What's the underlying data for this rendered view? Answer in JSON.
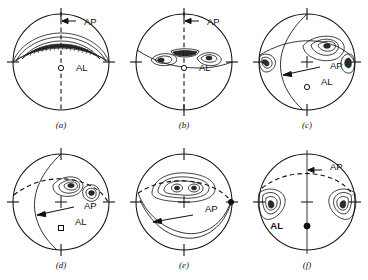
{
  "figure": {
    "type": "stereographic-projection-array",
    "rows": 2,
    "columns": 3,
    "background_color": "#ffffff",
    "line_color": "#111111"
  },
  "labels": {
    "ap": "AP",
    "al": "AL"
  },
  "panels": [
    {
      "id": "a",
      "caption": "(a)",
      "cx": 61,
      "cy": 62,
      "r": 48,
      "ap_label": "AP",
      "ap_label_x": 84,
      "ap_label_y": 25,
      "al_label": "AL",
      "al_label_x": 76,
      "al_label_y": 71,
      "al_marker_x": 61,
      "al_marker_y": 68,
      "al_marker_style": "open-circle",
      "axis_style": "dashed-vertical",
      "ap_arrow": "short-horizontal-left",
      "girdle": "narrow-horizontal-band",
      "fabric": "strong-girdle-with-dense-point-maximum",
      "has_center_cross": false
    },
    {
      "id": "b",
      "caption": "(b)",
      "cx": 184,
      "cy": 62,
      "r": 48,
      "ap_label": "AP",
      "ap_label_x": 207,
      "ap_label_y": 25,
      "al_label": "AL",
      "al_label_x": 199,
      "al_label_y": 71,
      "al_marker_x": 184,
      "al_marker_y": 68,
      "al_marker_style": "open-circle",
      "axis_style": "dashed-vertical",
      "ap_arrow": "short-horizontal-left",
      "girdle": "inclined-great-circle",
      "fabric": "two-lobes-plus-central-dense-maximum",
      "has_center_cross": false
    },
    {
      "id": "c",
      "caption": "(c)",
      "cx": 307,
      "cy": 62,
      "r": 48,
      "ap_label": "AP",
      "ap_label_x": 330,
      "ap_label_y": 69,
      "al_label": "AL",
      "al_label_x": 321,
      "al_label_y": 85,
      "al_marker_x": 307,
      "al_marker_y": 87,
      "al_marker_style": "open-circle",
      "axis_style": "inclined-great-circle",
      "ap_arrow": "long-diagonal-to-lower-left",
      "girdle": "inclined-girdle",
      "fabric": "one-strong-maximum-plus-edge-lobes",
      "has_center_cross": true
    },
    {
      "id": "d",
      "caption": "(d)",
      "cx": 61,
      "cy": 202,
      "r": 48,
      "ap_label": "AP",
      "ap_label_x": 84,
      "ap_label_y": 209,
      "al_label": "AL",
      "al_label_x": 75,
      "al_label_y": 225,
      "al_marker_x": 61,
      "al_marker_y": 228,
      "al_marker_style": "open-square",
      "axis_style": "inclined-great-circle",
      "ap_arrow": "long-diagonal-to-lower-left",
      "girdle": "dashed-inclined-girdle",
      "fabric": "two-separate-maxima",
      "has_center_cross": true
    },
    {
      "id": "e",
      "caption": "(e)",
      "cx": 184,
      "cy": 202,
      "r": 48,
      "ap_label": "AP",
      "ap_label_x": 205,
      "ap_label_y": 212,
      "al_label": "",
      "al_label_x": 0,
      "al_label_y": 0,
      "al_marker_x": 0,
      "al_marker_y": 0,
      "al_marker_style": "none",
      "axis_style": "dashed-small-circle",
      "ap_arrow": "short-diagonal-to-lower-left",
      "girdle": "broad-lower-girdle",
      "fabric": "elongate-contour-with-two-inner-maxima",
      "has_center_cross": true
    },
    {
      "id": "f",
      "caption": "(f)",
      "cx": 307,
      "cy": 202,
      "r": 48,
      "ap_label": "AP",
      "ap_label_x": 330,
      "ap_label_y": 170,
      "al_label": "AL",
      "al_label_x": 284,
      "al_label_y": 228,
      "al_marker_x": 307,
      "al_marker_y": 226,
      "al_marker_style": "solid-circle",
      "axis_style": "solid-vertical",
      "ap_arrow": "short-horizontal-left",
      "girdle": "dashed-upper-arc",
      "fabric": "two-edge-lobes-left-and-right",
      "has_center_cross": true
    }
  ]
}
